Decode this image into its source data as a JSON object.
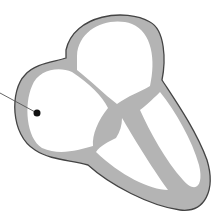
{
  "diagram": {
    "colors": {
      "wall_fill": "#b4b4b4",
      "outline": "#444444",
      "chamber": "#ffffff",
      "pointer": "#555555",
      "marker": "#111111"
    },
    "chambers": [
      {
        "id": "left-upper-chamber",
        "label": ""
      },
      {
        "id": "right-upper-chamber",
        "label": ""
      },
      {
        "id": "left-lower-chamber",
        "label": ""
      },
      {
        "id": "right-lower-chamber",
        "label": ""
      }
    ],
    "pointer": {
      "target": "left-upper-chamber",
      "label": ""
    }
  }
}
